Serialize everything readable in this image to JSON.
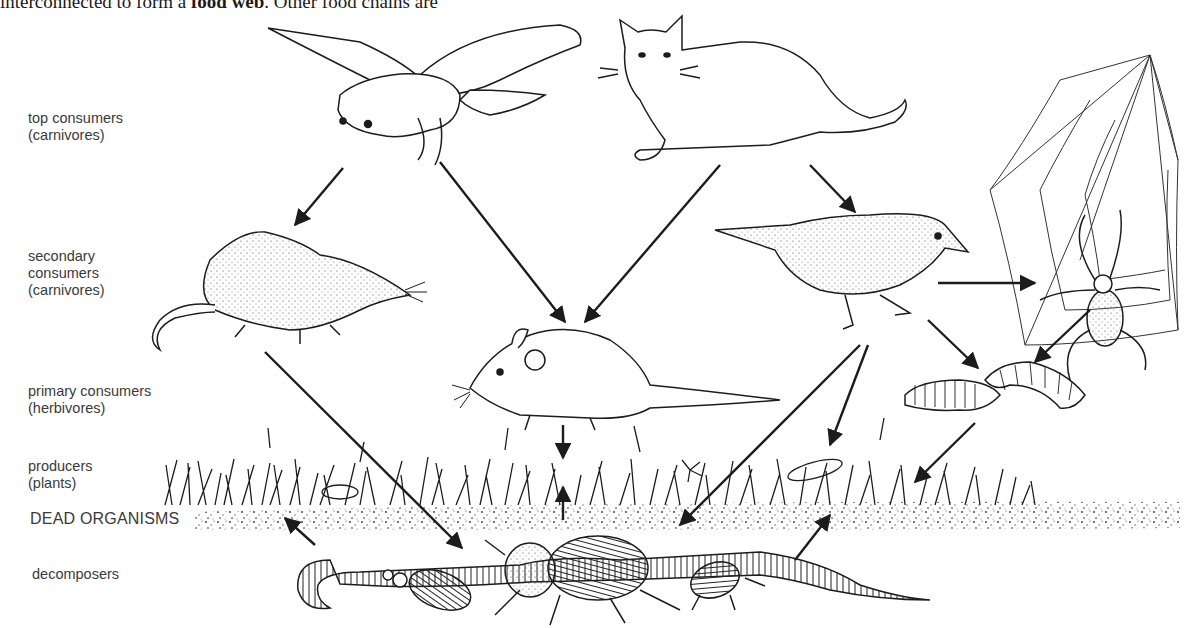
{
  "caption": {
    "text_before": "interconnected to form a ",
    "bold": "food web",
    "text_after": ". Other food chains are"
  },
  "levels": [
    {
      "id": "top",
      "label": "top consumers\n(carnivores)"
    },
    {
      "id": "secondary",
      "label": "secondary\nconsumers\n(carnivores)"
    },
    {
      "id": "primary",
      "label": "primary consumers\n(herbivores)"
    },
    {
      "id": "producers",
      "label": "producers\n(plants)"
    },
    {
      "id": "dead",
      "label": "DEAD ORGANISMS"
    },
    {
      "id": "decomposers",
      "label": "decomposers"
    }
  ],
  "organisms": [
    {
      "name": "owl",
      "level": "top"
    },
    {
      "name": "cat",
      "level": "top"
    },
    {
      "name": "shrew",
      "level": "secondary"
    },
    {
      "name": "thrush",
      "level": "secondary"
    },
    {
      "name": "spider",
      "level": "secondary"
    },
    {
      "name": "mouse",
      "level": "primary"
    },
    {
      "name": "caterpillars",
      "level": "primary"
    },
    {
      "name": "grass-and-plants",
      "level": "producers"
    },
    {
      "name": "dead-organic-matter",
      "level": "dead"
    },
    {
      "name": "earthworm",
      "level": "decomposers"
    },
    {
      "name": "beetles",
      "level": "decomposers"
    }
  ],
  "links": [
    {
      "from": "owl",
      "to": "shrew"
    },
    {
      "from": "owl",
      "to": "mouse"
    },
    {
      "from": "cat",
      "to": "mouse"
    },
    {
      "from": "cat",
      "to": "thrush"
    },
    {
      "from": "thrush",
      "to": "spider"
    },
    {
      "from": "thrush",
      "to": "caterpillars"
    },
    {
      "from": "spider",
      "to": "caterpillars"
    },
    {
      "from": "mouse",
      "to": "grass-and-plants"
    },
    {
      "from": "dead-organic-matter",
      "to": "mouse"
    },
    {
      "from": "thrush",
      "to": "plants"
    },
    {
      "from": "thrush",
      "to": "decomposers"
    },
    {
      "from": "caterpillars",
      "to": "plants"
    },
    {
      "from": "shrew",
      "to": "decomposers"
    },
    {
      "from": "decomposers",
      "to": "dead-organic-matter"
    }
  ],
  "colors": {
    "ink": "#1c1c1c",
    "label": "#3a3a3a",
    "background": "#ffffff"
  }
}
